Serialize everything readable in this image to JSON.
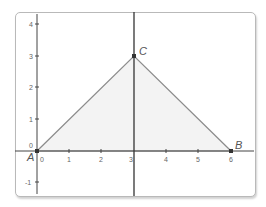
{
  "diagram": {
    "type": "coordinate-geometry",
    "x_ticks": [
      "0",
      "1",
      "2",
      "3",
      "4",
      "5",
      "6"
    ],
    "y_ticks": [
      "-1",
      "0",
      "1",
      "2",
      "3",
      "4"
    ],
    "points": [
      {
        "label": "A",
        "x": 0,
        "y": 0
      },
      {
        "label": "B",
        "x": 6,
        "y": 0
      },
      {
        "label": "C",
        "x": 3,
        "y": 3
      }
    ],
    "lines": [
      {
        "type": "vertical",
        "x": 3
      }
    ],
    "polygon": {
      "vertices": [
        "A",
        "B",
        "C"
      ],
      "fill": "#f2f2f2",
      "stroke": "#8c8c8c"
    },
    "colors": {
      "axis": "#444444",
      "triangle_stroke": "#8c8c8c",
      "frame": "#b9b9b9"
    }
  }
}
